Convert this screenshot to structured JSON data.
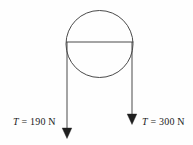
{
  "figure": {
    "background_color": "#fefefe",
    "stroke_color": "#4a4a4a",
    "text_color": "#1a1a1a"
  },
  "pulley": {
    "name": "pulley-circle",
    "center_x": 99.5,
    "center_y": 44,
    "radius": 33.5,
    "chord_y": 42,
    "chord_x_start": 66,
    "chord_x_end": 133
  },
  "forces": [
    {
      "id": "left",
      "symbol": "T",
      "equals": " = ",
      "magnitude": "190",
      "unit": " N",
      "label_text": "T = 190 N",
      "direction": "down",
      "line_x": 67,
      "line_y_start": 42,
      "line_y_end": 131,
      "arrow_tip_y": 138
    },
    {
      "id": "right",
      "symbol": "T",
      "equals": " = ",
      "magnitude": "300",
      "unit": " N",
      "label_text": "T = 300 N",
      "direction": "down",
      "line_x": 132,
      "line_y_start": 42,
      "line_y_end": 117,
      "arrow_tip_y": 124
    }
  ]
}
